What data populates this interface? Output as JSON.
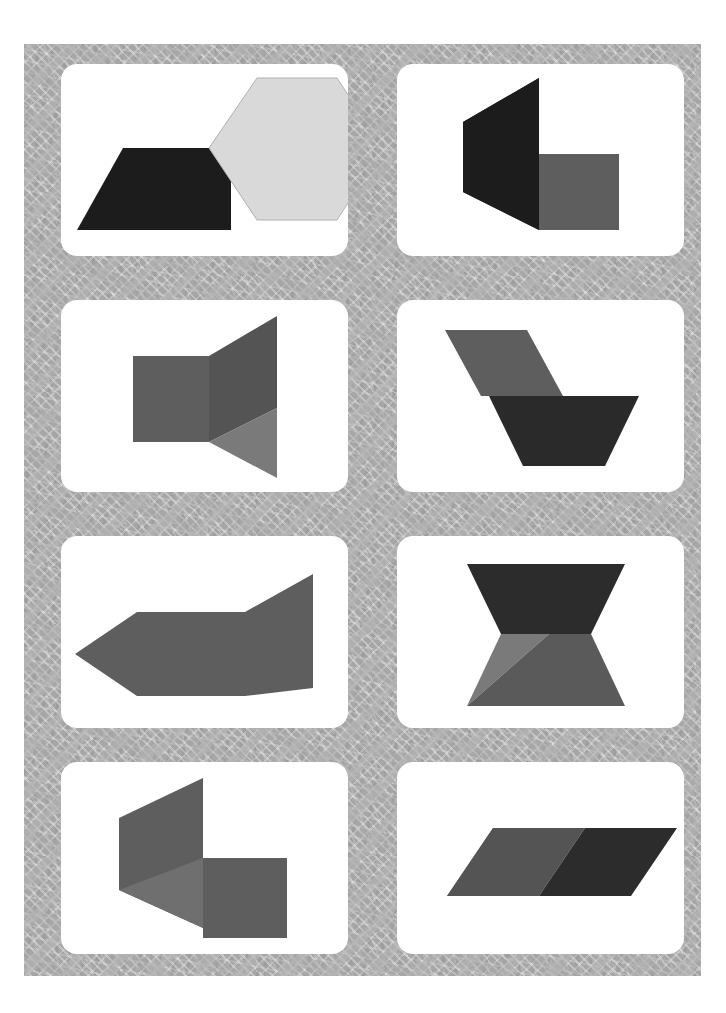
{
  "page": {
    "width": 726,
    "height": 1013,
    "background_color": "#ffffff",
    "mat": {
      "name": "patterned-gray-mat",
      "x": 24,
      "y": 44,
      "width": 677,
      "height": 932,
      "base_color": "#a6a6a6",
      "accent_color": "#b8b8b8",
      "description": "mottled gray surface with lighter hatched geometric strokes"
    }
  },
  "palette": {
    "card_white": "#ffffff",
    "near_black": "#1c1c1c",
    "dark_gray": "#3a3a3a",
    "mid_dark_gray": "#545454",
    "mid_gray": "#5e5e5e",
    "light_mid_gray": "#6b6b6b",
    "light_gray": "#7a7a7a",
    "pale_gray": "#d9d9d9",
    "outline_gray": "#b0b0b0"
  },
  "grid": {
    "columns": 2,
    "rows": 4,
    "card_width": 287,
    "card_height": 192,
    "col_x": [
      61,
      397
    ],
    "row_y": [
      64,
      300,
      536,
      762
    ]
  },
  "cards": [
    {
      "id": "card-1",
      "name": "card-trapezoid-hexagon",
      "row": 1,
      "column": 1,
      "shapes": [
        {
          "name": "dark-trapezoid",
          "type": "polygon",
          "fill": "#1c1c1c",
          "points": "16,166 62,84 170,84 170,166"
        },
        {
          "name": "light-hexagon",
          "type": "polygon",
          "fill": "#d9d9d9",
          "stroke": "#b0b0b0",
          "points": "148,84 196,14 276,14 322,84 276,156 196,156"
        }
      ]
    },
    {
      "id": "card-2",
      "name": "card-black-chevron-gray-square",
      "row": 1,
      "column": 2,
      "shapes": [
        {
          "name": "black-chevron",
          "type": "polygon",
          "fill": "#1c1c1c",
          "points": "142,14 142,166 66,128 66,58"
        },
        {
          "name": "black-left-wedge",
          "type": "polygon",
          "fill": "#1c1c1c",
          "points": "66,58 142,14 142,166 66,128"
        },
        {
          "name": "gray-square",
          "type": "polygon",
          "fill": "#5e5e5e",
          "points": "142,90 222,90 222,166 142,166"
        }
      ]
    },
    {
      "id": "card-3",
      "name": "card-square-with-fan",
      "row": 2,
      "column": 1,
      "shapes": [
        {
          "name": "gray-square",
          "type": "polygon",
          "fill": "#5e5e5e",
          "points": "72,56 148,56 148,142 72,142"
        },
        {
          "name": "dark-upper-wedge",
          "type": "polygon",
          "fill": "#545454",
          "points": "148,56 216,16 216,108 148,142"
        },
        {
          "name": "light-lower-wedge",
          "type": "polygon",
          "fill": "#7a7a7a",
          "points": "148,142 216,108 216,178"
        }
      ]
    },
    {
      "id": "card-4",
      "name": "card-parallelogram-over-trapezoid",
      "row": 2,
      "column": 2,
      "shapes": [
        {
          "name": "gray-parallelogram",
          "type": "polygon",
          "fill": "#5e5e5e",
          "points": "48,30 130,30 166,96 84,96"
        },
        {
          "name": "dark-trapezoid",
          "type": "polygon",
          "fill": "#2a2a2a",
          "points": "92,96 242,96 208,166 126,166"
        }
      ]
    },
    {
      "id": "card-5",
      "name": "card-arrow-square-panel",
      "row": 3,
      "column": 1,
      "shapes": [
        {
          "name": "left-triangle",
          "type": "polygon",
          "fill": "#5e5e5e",
          "points": "14,118 76,76 76,160"
        },
        {
          "name": "center-square",
          "type": "polygon",
          "fill": "#5e5e5e",
          "points": "76,76 184,76 184,160 76,160"
        },
        {
          "name": "right-panel",
          "type": "polygon",
          "fill": "#5e5e5e",
          "points": "184,76 252,38 252,152 184,160"
        }
      ]
    },
    {
      "id": "card-6",
      "name": "card-hourglass-bowtie",
      "row": 3,
      "column": 2,
      "shapes": [
        {
          "name": "dark-upper-trapezoid",
          "type": "polygon",
          "fill": "#2c2c2c",
          "points": "70,28 228,28 194,98 104,98"
        },
        {
          "name": "light-lower-left-triangle",
          "type": "polygon",
          "fill": "#7a7a7a",
          "points": "104,98 152,98 70,170"
        },
        {
          "name": "mid-lower-parallelogram",
          "type": "polygon",
          "fill": "#5a5a5a",
          "points": "152,98 194,98 228,170 70,170"
        }
      ]
    },
    {
      "id": "card-7",
      "name": "card-gray-chevron-gray-square",
      "row": 4,
      "column": 1,
      "shapes": [
        {
          "name": "gray-chevron-panel",
          "type": "polygon",
          "fill": "#5e5e5e",
          "points": "58,56 142,16 142,166 58,128"
        },
        {
          "name": "pale-floor-triangle",
          "type": "polygon",
          "fill": "#6f6f6f",
          "points": "58,128 142,96 142,166"
        },
        {
          "name": "gray-square",
          "type": "polygon",
          "fill": "#5e5e5e",
          "points": "142,96 226,96 226,176 142,176"
        }
      ]
    },
    {
      "id": "card-8",
      "name": "card-triangle-two-parallelograms",
      "row": 4,
      "column": 2,
      "shapes": [
        {
          "name": "light-triangle",
          "type": "polygon",
          "fill": "#7a7a7a",
          "points": "50,134 96,66 142,134"
        },
        {
          "name": "mid-parallelogram",
          "type": "polygon",
          "fill": "#545454",
          "points": "96,66 188,66 142,134 50,134"
        },
        {
          "name": "dark-parallelogram",
          "type": "polygon",
          "fill": "#2c2c2c",
          "points": "188,66 280,66 234,134 142,134"
        }
      ]
    }
  ]
}
